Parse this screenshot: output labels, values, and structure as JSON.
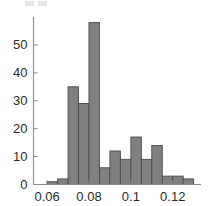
{
  "figure": {
    "background_color": "#ffffff",
    "axis_color": "#8a8a8a",
    "bar_fill_color": "#808080",
    "bar_edge_color": "#4a4a4a",
    "tick_label_color": "#2b2b2b"
  },
  "chart_data": {
    "type": "bar",
    "title": "",
    "subtitle": "",
    "xlabel": "",
    "ylabel": "",
    "grid": false,
    "legend": null,
    "legend_position": "none",
    "annotations": [],
    "xlim": [
      0.0535,
      0.1335
    ],
    "ylim": [
      0,
      60
    ],
    "xticks": [
      0.06,
      0.08,
      0.1,
      0.12
    ],
    "xtick_labels": [
      "0.06",
      "0.08",
      "0.1",
      "0.12"
    ],
    "yticks": [
      0,
      10,
      20,
      30,
      40,
      50
    ],
    "ytick_labels": [
      "0",
      "10",
      "20",
      "30",
      "40",
      "50"
    ],
    "bin_width": 0.005,
    "bin_edges": [
      0.055,
      0.06,
      0.065,
      0.07,
      0.075,
      0.08,
      0.085,
      0.09,
      0.095,
      0.1,
      0.105,
      0.11,
      0.115,
      0.12,
      0.125,
      0.13
    ],
    "categories": [
      "0.055-0.060",
      "0.060-0.065",
      "0.065-0.070",
      "0.070-0.075",
      "0.075-0.080",
      "0.080-0.085",
      "0.085-0.090",
      "0.090-0.095",
      "0.095-0.100",
      "0.100-0.105",
      "0.105-0.110",
      "0.110-0.115",
      "0.115-0.120",
      "0.120-0.125",
      "0.125-0.130"
    ],
    "values": [
      0,
      1,
      2,
      35,
      29,
      58,
      6,
      12,
      9,
      17,
      9,
      14,
      3,
      3,
      2
    ]
  }
}
